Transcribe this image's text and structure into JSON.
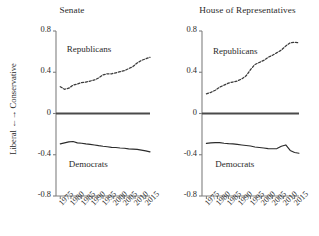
{
  "figure": {
    "ylabel": "Liberal ←→ Conservative",
    "yticks": [
      "0.8",
      "0.4",
      "0",
      "-0.4",
      "-0.8"
    ],
    "ytick_values": [
      0.8,
      0.4,
      0,
      -0.4,
      -0.8
    ],
    "xticks": [
      "1975",
      "1980",
      "1985",
      "1990",
      "1995",
      "2000",
      "2005",
      "2010",
      "2015"
    ],
    "colors": {
      "axis": "#808080",
      "republican_line": "#3a3a3a",
      "democrat_line": "#2b2b2b",
      "zero_line": "#4a4a4a",
      "text": "#2a2a2a",
      "background": "#ffffff"
    }
  },
  "chart_data": [
    {
      "type": "line",
      "title": "Senate",
      "xlabel": "",
      "ylabel": "Liberal ←→ Conservative",
      "xlim": [
        1973,
        2017
      ],
      "ylim": [
        -0.8,
        0.8
      ],
      "grid": false,
      "legend": "inline-annotations",
      "x": [
        1975,
        1977,
        1979,
        1981,
        1983,
        1985,
        1987,
        1989,
        1991,
        1993,
        1995,
        1997,
        1999,
        2001,
        2003,
        2005,
        2007,
        2009,
        2011,
        2013,
        2015,
        2017
      ],
      "series": [
        {
          "name": "Republicans",
          "style": "dashed",
          "values": [
            0.26,
            0.235,
            0.245,
            0.275,
            0.285,
            0.3,
            0.305,
            0.315,
            0.325,
            0.345,
            0.375,
            0.385,
            0.385,
            0.395,
            0.405,
            0.415,
            0.435,
            0.455,
            0.49,
            0.515,
            0.53,
            0.545
          ]
        },
        {
          "name": "Democrats",
          "style": "solid",
          "values": [
            -0.295,
            -0.285,
            -0.275,
            -0.272,
            -0.285,
            -0.288,
            -0.295,
            -0.3,
            -0.305,
            -0.312,
            -0.318,
            -0.322,
            -0.328,
            -0.33,
            -0.335,
            -0.337,
            -0.343,
            -0.345,
            -0.348,
            -0.355,
            -0.362,
            -0.372
          ]
        }
      ],
      "annotations": [
        {
          "text": "Republicans",
          "x": 1978,
          "y": 0.62
        },
        {
          "text": "Democrats",
          "x": 1979,
          "y": -0.5
        }
      ]
    },
    {
      "type": "line",
      "title": "House of Representatives",
      "xlabel": "",
      "ylabel": "Liberal ←→ Conservative",
      "xlim": [
        1973,
        2017
      ],
      "ylim": [
        -0.8,
        0.8
      ],
      "grid": false,
      "legend": "inline-annotations",
      "x": [
        1975,
        1977,
        1979,
        1981,
        1983,
        1985,
        1987,
        1989,
        1991,
        1993,
        1995,
        1997,
        1999,
        2001,
        2003,
        2005,
        2007,
        2009,
        2011,
        2013,
        2015,
        2017
      ],
      "series": [
        {
          "name": "Republicans",
          "style": "dashed",
          "values": [
            0.19,
            0.205,
            0.225,
            0.255,
            0.275,
            0.295,
            0.305,
            0.315,
            0.335,
            0.365,
            0.425,
            0.475,
            0.495,
            0.515,
            0.545,
            0.565,
            0.59,
            0.615,
            0.655,
            0.685,
            0.69,
            0.685
          ]
        },
        {
          "name": "Democrats",
          "style": "solid",
          "values": [
            -0.29,
            -0.285,
            -0.283,
            -0.282,
            -0.288,
            -0.292,
            -0.295,
            -0.3,
            -0.305,
            -0.31,
            -0.315,
            -0.325,
            -0.33,
            -0.335,
            -0.34,
            -0.342,
            -0.34,
            -0.318,
            -0.305,
            -0.358,
            -0.378,
            -0.385
          ]
        }
      ],
      "annotations": [
        {
          "text": "Republicans",
          "x": 1978,
          "y": 0.6
        },
        {
          "text": "Democrats",
          "x": 1979,
          "y": -0.5
        }
      ]
    }
  ]
}
